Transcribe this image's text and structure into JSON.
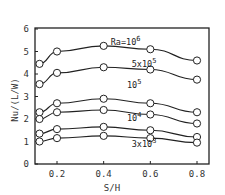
{
  "chart_data": {
    "type": "line",
    "title": "",
    "xlabel": "S/H",
    "ylabel": "Nu/(L/W)",
    "xlim": [
      0.1,
      0.85
    ],
    "ylim": [
      0,
      6
    ],
    "xticks": [
      "0.2",
      "0.4",
      "0.6",
      "0.8"
    ],
    "yticks": [
      "0",
      "1",
      "2",
      "3",
      "4",
      "5",
      "6"
    ],
    "grid": false,
    "x": [
      0.125,
      0.2,
      0.4,
      0.6,
      0.8
    ],
    "series": [
      {
        "name": "Ra=10^6",
        "values": [
          4.45,
          5.0,
          5.25,
          5.1,
          4.6
        ]
      },
      {
        "name": "5x10^5",
        "values": [
          3.55,
          4.05,
          4.3,
          4.2,
          3.75
        ]
      },
      {
        "name": "10^5 (upper)",
        "values": [
          2.3,
          2.7,
          2.9,
          2.7,
          2.3
        ]
      },
      {
        "name": "10^5 (lower)",
        "values": [
          2.0,
          2.3,
          2.4,
          2.2,
          1.8
        ]
      },
      {
        "name": "10^4",
        "values": [
          1.35,
          1.55,
          1.65,
          1.5,
          1.2
        ]
      },
      {
        "name": "3x10^3",
        "values": [
          1.0,
          1.15,
          1.25,
          1.15,
          0.95
        ]
      }
    ],
    "annotations": [
      {
        "text": "Ra=10",
        "sup": "6",
        "x": 0.43,
        "y": 5.3
      },
      {
        "text": "5x10",
        "sup": "5",
        "x": 0.52,
        "y": 4.3
      },
      {
        "text": "10",
        "sup": "5",
        "x": 0.5,
        "y": 3.4
      },
      {
        "text": "10",
        "sup": "4",
        "x": 0.5,
        "y": 1.9
      },
      {
        "text": "3x10",
        "sup": "3",
        "x": 0.52,
        "y": 0.75
      }
    ]
  }
}
